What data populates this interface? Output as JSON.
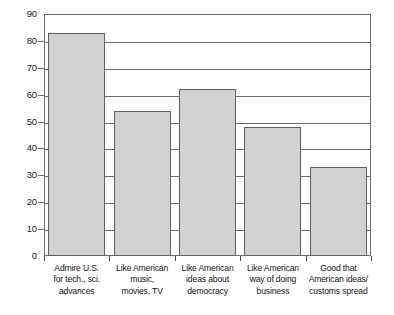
{
  "chart_data": {
    "type": "bar",
    "title": "",
    "xlabel": "",
    "ylabel": "",
    "ylim": [
      0,
      90
    ],
    "ytick_step": 10,
    "yticks": [
      0,
      10,
      20,
      30,
      40,
      50,
      60,
      70,
      80,
      90
    ],
    "ytick_labels": [
      "0",
      "10",
      "20",
      "30",
      "40",
      "50",
      "60",
      "70",
      "80",
      "90"
    ],
    "grid": true,
    "grid_axis": "y",
    "legend": false,
    "legend_position": "none",
    "categories": [
      "Admire U.S. for tech., sci. advances",
      "Like American music, movies, TV",
      "Like American ideas about democracy",
      "Like American way of doing business",
      "Good that American ideas/customs spread"
    ],
    "category_label_lines": [
      [
        "Admire U.S.",
        "for tech., sci.",
        "advances"
      ],
      [
        "Like American",
        "music,",
        "movies, TV"
      ],
      [
        "Like American",
        "ideas about",
        "democracy"
      ],
      [
        "Like American",
        "way of doing",
        "business"
      ],
      [
        "Good that",
        "American ideas/",
        "customs spread"
      ]
    ],
    "values": [
      83,
      54,
      62,
      48,
      33
    ],
    "bar_fill_color": "#d2d2d2",
    "bar_border_color": "#5f5f5f",
    "grid_color": "#6d6d6d",
    "axis_color": "#6d6d6d",
    "text_color": "#141414"
  }
}
